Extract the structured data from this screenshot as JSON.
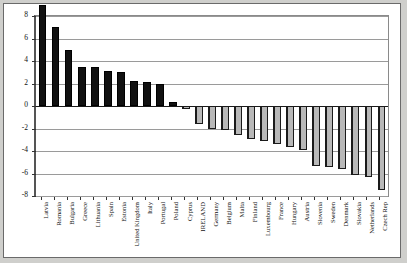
{
  "chart_data": {
    "type": "bar",
    "title": "",
    "subtitle": "",
    "xlabel": "",
    "ylabel": "",
    "ylim": [
      -8,
      8
    ],
    "ytick_step": 2,
    "yticks": [
      8,
      6,
      4,
      2,
      0,
      -2,
      -4,
      -6,
      -8
    ],
    "ytick_labels": [
      "8",
      "6",
      "4",
      "2",
      "0",
      "-2",
      "-4",
      "-6",
      "-8"
    ],
    "grid": true,
    "legend": "none",
    "categories": [
      "Latvia",
      "Romania",
      "Bulgaria",
      "Greece",
      "Lithuania",
      "Spain",
      "Estonia",
      "United Kingdom",
      "Italy",
      "Portugal",
      "Poland",
      "Cyprus",
      "IRELAND",
      "Germany",
      "Belgium",
      "Malta",
      "Finland",
      "Luxembourg",
      "France",
      "Hungary",
      "Austria",
      "Slovenia",
      "Sweden",
      "Denmark",
      "Slovakia",
      "Netherlands",
      "Czech Rep"
    ],
    "values": [
      9.0,
      7.0,
      5.0,
      3.5,
      3.5,
      3.1,
      3.0,
      2.2,
      2.1,
      2.0,
      0.4,
      -0.3,
      -1.6,
      -2.0,
      -2.1,
      -2.6,
      -2.9,
      -3.1,
      -3.4,
      -3.6,
      -3.9,
      -5.3,
      -5.4,
      -5.6,
      -6.1,
      -6.3,
      -7.5
    ],
    "highlight_category": "IRELAND"
  },
  "style": {
    "bar_positive_color": "#111111",
    "bar_negative_color": "#b8b8b8",
    "bar_outline_color": "#1a1a1a",
    "grid_color": "#9a9a9a",
    "axis_color": "#555555",
    "page_background": "#cfcfcc",
    "plot_background": "#ffffff"
  }
}
